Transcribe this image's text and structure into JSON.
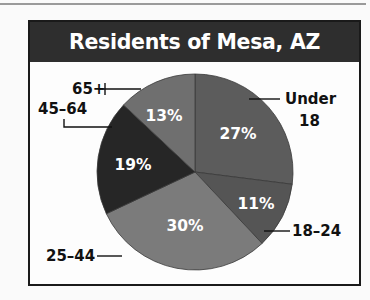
{
  "title": "Residents of Mesa, AZ",
  "chart_data": {
    "type": "pie",
    "title": "Residents of Mesa, AZ",
    "categories": [
      "Under 18",
      "18–24",
      "25–44",
      "45–64",
      "65+"
    ],
    "values": [
      27,
      11,
      30,
      19,
      13
    ],
    "unit": "%",
    "start_angle_deg": 0,
    "direction": "clockwise",
    "colors": [
      "#5c5c5c",
      "#555555",
      "#7b7b7b",
      "#262626",
      "#6f6f6f"
    ],
    "legend": "callout labels"
  },
  "labels": {
    "under18_line1": "Under",
    "under18_line2": "18",
    "a18_24": "18–24",
    "a25_44": "25–44",
    "a45_64": "45–64",
    "a65": "65+"
  },
  "percents": {
    "under18": "27%",
    "a18_24": "11%",
    "a25_44": "30%",
    "a45_64": "19%",
    "a65": "13%"
  }
}
